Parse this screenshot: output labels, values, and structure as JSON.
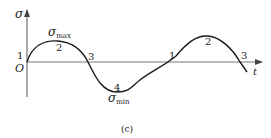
{
  "diagram": {
    "type": "stress-time cycle",
    "caption": "(c)",
    "axes": {
      "y_label": "σ",
      "x_label": "t",
      "origin_label": "O"
    },
    "annotations": {
      "sigma_max": {
        "symbol": "σ",
        "subscript": "max"
      },
      "sigma_min": {
        "symbol": "σ",
        "subscript": "min"
      }
    },
    "points": [
      {
        "label": "1",
        "position": "start / origin crossing"
      },
      {
        "label": "2",
        "position": "first peak (σmax)"
      },
      {
        "label": "3",
        "position": "first descending zero crossing"
      },
      {
        "label": "4",
        "position": "trough (σmin)"
      },
      {
        "label": "1",
        "position": "ascending zero crossing"
      },
      {
        "label": "2",
        "position": "second peak"
      },
      {
        "label": "3",
        "position": "second descending zero crossing"
      }
    ],
    "colors": {
      "curve": "#1a1a1a",
      "axis": "#555555",
      "text": "#222222",
      "background": "#ffffff"
    }
  }
}
